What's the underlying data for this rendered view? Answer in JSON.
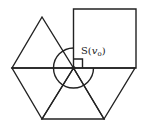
{
  "diagram": {
    "label": {
      "prefix": "S(",
      "variable": "v",
      "subscript": "o",
      "suffix": ")"
    },
    "colors": {
      "stroke": "#222222",
      "background": "#ffffff"
    },
    "vertex": {
      "x": 73.5,
      "y": 68,
      "name": "v_o"
    },
    "angle_circle_radius": 20,
    "right_angle_marker_size": 9,
    "faces": [
      {
        "type": "square",
        "points": [
          [
            73.5,
            68
          ],
          [
            73.5,
            9
          ],
          [
            136,
            9
          ],
          [
            136,
            68
          ]
        ]
      },
      {
        "type": "triangle",
        "points": [
          [
            73.5,
            68
          ],
          [
            12,
            68
          ],
          [
            42,
            17
          ]
        ]
      },
      {
        "type": "triangle",
        "points": [
          [
            73.5,
            68
          ],
          [
            12,
            68
          ],
          [
            42,
            119
          ]
        ]
      },
      {
        "type": "triangle",
        "points": [
          [
            73.5,
            68
          ],
          [
            42,
            119
          ],
          [
            104,
            119
          ]
        ]
      },
      {
        "type": "triangle",
        "points": [
          [
            73.5,
            68
          ],
          [
            104,
            119
          ],
          [
            135,
            68
          ]
        ]
      }
    ]
  }
}
